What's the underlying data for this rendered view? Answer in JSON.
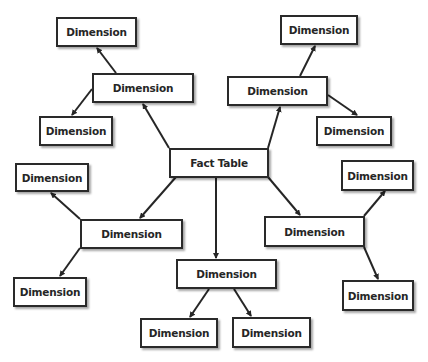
{
  "diagram": {
    "type": "star-schema",
    "colors": {
      "line": "#262626",
      "box_border": "#2a2a2a",
      "text": "#262626",
      "background": "#ffffff"
    },
    "center": {
      "id": "fact",
      "label": "Fact Table"
    },
    "nodes": [
      {
        "id": "fact",
        "label": "Fact Table",
        "x": 169,
        "y": 148,
        "w": 100,
        "h": 30
      },
      {
        "id": "d_ul",
        "label": "Dimension",
        "x": 92,
        "y": 73,
        "w": 102,
        "h": 30
      },
      {
        "id": "d_ul_top",
        "label": "Dimension",
        "x": 56,
        "y": 17,
        "w": 81,
        "h": 30
      },
      {
        "id": "d_ul_low",
        "label": "Dimension",
        "x": 39,
        "y": 116,
        "w": 74,
        "h": 30
      },
      {
        "id": "d_ur",
        "label": "Dimension",
        "x": 227,
        "y": 76,
        "w": 101,
        "h": 30
      },
      {
        "id": "d_ur_top",
        "label": "Dimension",
        "x": 280,
        "y": 15,
        "w": 78,
        "h": 30
      },
      {
        "id": "d_ur_low",
        "label": "Dimension",
        "x": 316,
        "y": 116,
        "w": 76,
        "h": 30
      },
      {
        "id": "d_l",
        "label": "Dimension",
        "x": 80,
        "y": 219,
        "w": 103,
        "h": 30
      },
      {
        "id": "d_l_top",
        "label": "Dimension",
        "x": 15,
        "y": 163,
        "w": 74,
        "h": 29
      },
      {
        "id": "d_l_low",
        "label": "Dimension",
        "x": 13,
        "y": 277,
        "w": 74,
        "h": 30
      },
      {
        "id": "d_b",
        "label": "Dimension",
        "x": 176,
        "y": 259,
        "w": 101,
        "h": 30
      },
      {
        "id": "d_b_left",
        "label": "Dimension",
        "x": 140,
        "y": 318,
        "w": 78,
        "h": 30
      },
      {
        "id": "d_b_right",
        "label": "Dimension",
        "x": 232,
        "y": 317,
        "w": 79,
        "h": 31
      },
      {
        "id": "d_r",
        "label": "Dimension",
        "x": 264,
        "y": 216,
        "w": 101,
        "h": 31
      },
      {
        "id": "d_r_top",
        "label": "Dimension",
        "x": 341,
        "y": 160,
        "w": 73,
        "h": 31
      },
      {
        "id": "d_r_low",
        "label": "Dimension",
        "x": 342,
        "y": 280,
        "w": 72,
        "h": 31
      }
    ],
    "edges": [
      {
        "from": "fact",
        "to": "d_ul",
        "x1": 169,
        "y1": 148,
        "x2": 143,
        "y2": 104
      },
      {
        "from": "fact",
        "to": "d_ur",
        "x1": 268,
        "y1": 148,
        "x2": 280,
        "y2": 107
      },
      {
        "from": "fact",
        "to": "d_l",
        "x1": 176,
        "y1": 177,
        "x2": 140,
        "y2": 218
      },
      {
        "from": "fact",
        "to": "d_b",
        "x1": 216,
        "y1": 177,
        "x2": 216,
        "y2": 258
      },
      {
        "from": "fact",
        "to": "d_r",
        "x1": 268,
        "y1": 177,
        "x2": 300,
        "y2": 215
      },
      {
        "from": "d_ul",
        "to": "d_ul_top",
        "x1": 116,
        "y1": 73,
        "x2": 97,
        "y2": 48
      },
      {
        "from": "d_ul",
        "to": "d_ul_low",
        "x1": 92,
        "y1": 89,
        "x2": 72,
        "y2": 115
      },
      {
        "from": "d_ur",
        "to": "d_ur_top",
        "x1": 300,
        "y1": 76,
        "x2": 315,
        "y2": 46
      },
      {
        "from": "d_ur",
        "to": "d_ur_low",
        "x1": 328,
        "y1": 95,
        "x2": 357,
        "y2": 115
      },
      {
        "from": "d_l",
        "to": "d_l_top",
        "x1": 80,
        "y1": 219,
        "x2": 51,
        "y2": 193
      },
      {
        "from": "d_l",
        "to": "d_l_low",
        "x1": 80,
        "y1": 248,
        "x2": 60,
        "y2": 276
      },
      {
        "from": "d_b",
        "to": "d_b_left",
        "x1": 209,
        "y1": 289,
        "x2": 190,
        "y2": 317
      },
      {
        "from": "d_b",
        "to": "d_b_right",
        "x1": 234,
        "y1": 289,
        "x2": 251,
        "y2": 316
      },
      {
        "from": "d_r",
        "to": "d_r_top",
        "x1": 364,
        "y1": 216,
        "x2": 385,
        "y2": 191
      },
      {
        "from": "d_r",
        "to": "d_r_low",
        "x1": 364,
        "y1": 247,
        "x2": 378,
        "y2": 279
      }
    ]
  }
}
